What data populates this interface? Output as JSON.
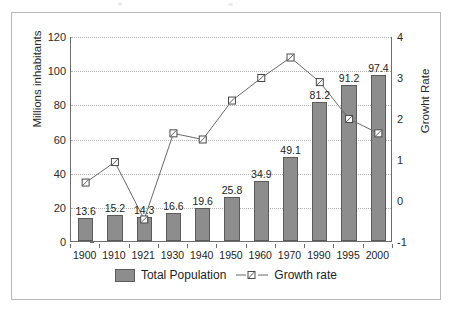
{
  "chart_data": {
    "type": "bar",
    "title": "",
    "subtitle": "",
    "xlabel": "",
    "ylabel": "Millions inhabitants",
    "y2label": "Growht Rate",
    "categories": [
      "1900",
      "1910",
      "1921",
      "1930",
      "1940",
      "1950",
      "1960",
      "1970",
      "1990",
      "1995",
      "2000"
    ],
    "ylim": [
      0,
      120
    ],
    "yticks": [
      0,
      20,
      40,
      60,
      80,
      100,
      120
    ],
    "y2lim": [
      -1,
      4
    ],
    "y2ticks": [
      -1,
      0,
      1,
      2,
      3,
      4
    ],
    "grid": true,
    "legend_position": "bottom",
    "series": [
      {
        "name": "Total Population",
        "type": "bar",
        "axis": "left",
        "color": "#8d8d8d",
        "values": [
          13.6,
          15.2,
          14.3,
          16.6,
          19.6,
          25.8,
          34.9,
          49.1,
          81.2,
          91.2,
          97.4
        ],
        "labels": [
          "13.6",
          "15.2",
          "14.3",
          "16.6",
          "19.6",
          "25.8",
          "34.9",
          "49.1",
          "81.2",
          "91.2",
          "97.4"
        ]
      },
      {
        "name": "Growth rate",
        "type": "line",
        "axis": "right",
        "color": "#6b6b6b",
        "values": [
          0.45,
          0.95,
          -0.45,
          1.65,
          1.5,
          2.45,
          3.0,
          3.5,
          2.9,
          2.0,
          1.65
        ]
      }
    ]
  },
  "axes": {
    "left_title": "Millions inhabitants",
    "right_title": "Growht Rate",
    "left_ticks": [
      "120",
      "100",
      "80",
      "60",
      "40",
      "20",
      "0"
    ],
    "right_ticks": [
      "4",
      "3",
      "2",
      "1",
      "0",
      "-1"
    ],
    "x_ticks": [
      "1900",
      "1910",
      "1921",
      "1930",
      "1940",
      "1950",
      "1960",
      "1970",
      "1990",
      "1995",
      "2000"
    ]
  },
  "legend": {
    "bar_label": "Total Population",
    "line_label": "Growth rate"
  }
}
